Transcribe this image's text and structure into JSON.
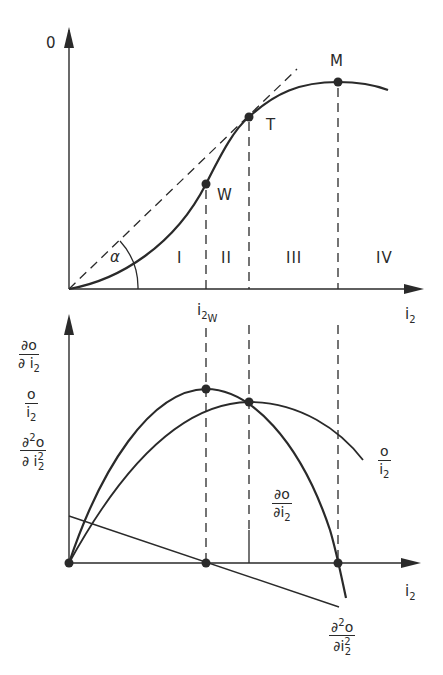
{
  "top_chart": {
    "y_axis_label": "0",
    "x_axis_label": "i",
    "x_axis_label_sub": "2",
    "x_tick_label": "i",
    "x_tick_label_sub": "2",
    "x_tick_label_subsub": "W",
    "angle_label": "α",
    "points": [
      {
        "name": "W",
        "label": "W"
      },
      {
        "name": "T",
        "label": "T"
      },
      {
        "name": "M",
        "label": "M"
      }
    ],
    "regions": [
      "I",
      "II",
      "III",
      "IV"
    ]
  },
  "bottom_chart": {
    "y_axis_labels": [
      {
        "num": "∂o",
        "den": "∂ i",
        "den_sub": "2"
      },
      {
        "num": "o",
        "den": "i",
        "den_sub": "2"
      },
      {
        "num": "∂",
        "num_sup": "2",
        "num_tail": "o",
        "den": "∂ i",
        "den_sub": "2",
        "den_sup": "2"
      }
    ],
    "x_axis_label": "i",
    "x_axis_label_sub": "2",
    "curve_labels": {
      "avg": {
        "num": "o",
        "den": "i",
        "den_sub": "2"
      },
      "marginal": {
        "num": "∂o",
        "den": "∂i",
        "den_sub": "2"
      },
      "second": {
        "num": "∂",
        "num_sup": "2",
        "num_tail": "o",
        "den": "∂i",
        "den_sub": "2",
        "den_sup": "2"
      }
    }
  },
  "colors": {
    "ink": "#2a2a2a",
    "background": "#ffffff"
  }
}
